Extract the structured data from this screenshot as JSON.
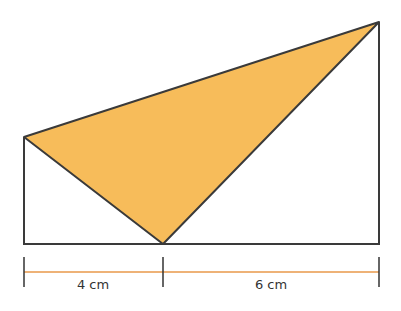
{
  "diagram": {
    "colors": {
      "fill": "#f7bc5a",
      "stroke": "#3a3a3a",
      "dimension_line": "#e8994a",
      "tick": "#333333"
    },
    "measurements": [
      {
        "label": "4 cm",
        "value": 4,
        "unit": "cm"
      },
      {
        "label": "6 cm",
        "value": 6,
        "unit": "cm"
      }
    ],
    "shapes": {
      "outline": "right trapezoid with vertical sides on left and right",
      "shaded_triangle": "triangle connecting top of left side, top of right side, and point on base"
    }
  }
}
